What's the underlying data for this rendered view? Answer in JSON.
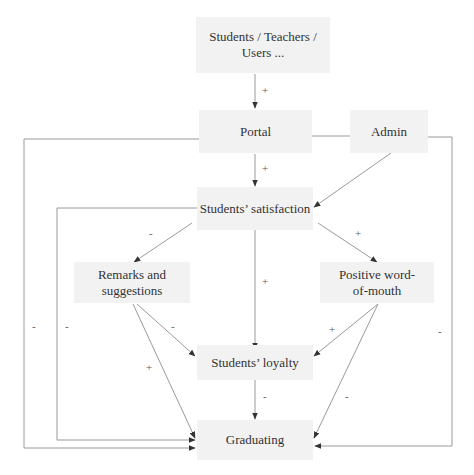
{
  "diagram": {
    "type": "causal-loop",
    "nodes": {
      "users": "Students / Teachers / Users ...",
      "portal": "Portal",
      "admin": "Admin",
      "satisfaction": "Students’ satisfaction",
      "remarks": "Remarks and suggestions",
      "word_of_mouth": "Positive word-of-mouth",
      "loyalty": "Students’ loyalty",
      "graduating": "Graduating"
    },
    "edges": [
      {
        "from": "users",
        "to": "portal",
        "sign": "+"
      },
      {
        "from": "portal",
        "to": "satisfaction",
        "sign": "+"
      },
      {
        "from": "admin",
        "to": "satisfaction",
        "sign": ""
      },
      {
        "from": "satisfaction",
        "to": "remarks",
        "sign": "-"
      },
      {
        "from": "satisfaction",
        "to": "word_of_mouth",
        "sign": "+"
      },
      {
        "from": "satisfaction",
        "to": "loyalty",
        "sign": "+"
      },
      {
        "from": "remarks",
        "to": "loyalty",
        "sign": "-"
      },
      {
        "from": "remarks",
        "to": "graduating",
        "sign": "+"
      },
      {
        "from": "word_of_mouth",
        "to": "loyalty",
        "sign": "+"
      },
      {
        "from": "word_of_mouth",
        "to": "graduating",
        "sign": "-"
      },
      {
        "from": "loyalty",
        "to": "graduating",
        "sign": "-"
      },
      {
        "from": "portal",
        "to": "graduating",
        "sign": "-"
      },
      {
        "from": "satisfaction",
        "to": "graduating",
        "sign": "-"
      },
      {
        "from": "admin",
        "to": "graduating",
        "sign": "-"
      }
    ],
    "labels": {
      "users_portal": "+",
      "portal_satisfaction": "+",
      "satisfaction_remarks": "-",
      "satisfaction_wom": "+",
      "satisfaction_loyalty": "+",
      "remarks_loyalty": "-",
      "remarks_graduating": "+",
      "wom_loyalty": "+",
      "wom_graduating": "-",
      "loyalty_graduating": "-",
      "portal_graduating": "-",
      "satisfaction_graduating": "-",
      "admin_graduating": "-"
    },
    "colors": {
      "node_fill": "#f2f2f2",
      "line": "#999999",
      "arrow": "#333333",
      "text": "#333333"
    }
  }
}
